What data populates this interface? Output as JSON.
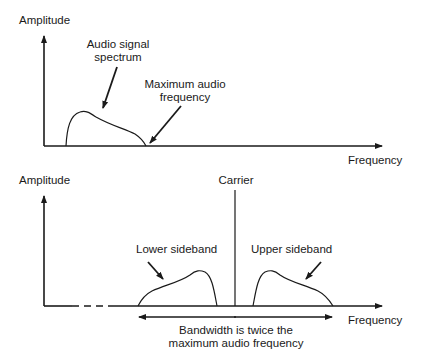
{
  "top_panel": {
    "y_axis_label": "Amplitude",
    "x_axis_label": "Frequency",
    "annotations": {
      "spectrum_line1": "Audio signal",
      "spectrum_line2": "spectrum",
      "max_freq_line1": "Maximum audio",
      "max_freq_line2": "frequency"
    }
  },
  "bottom_panel": {
    "y_axis_label": "Amplitude",
    "x_axis_label": "Frequency",
    "carrier_label": "Carrier",
    "lower_sideband_label": "Lower sideband",
    "upper_sideband_label": "Upper sideband",
    "bandwidth_line1": "Bandwidth is twice the",
    "bandwidth_line2": "maximum audio frequency"
  },
  "colors": {
    "ink": "#1a1a1a",
    "background": "#ffffff"
  }
}
